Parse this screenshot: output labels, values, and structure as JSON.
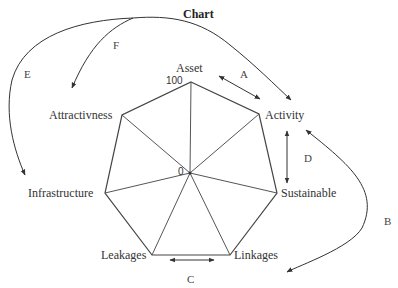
{
  "title": "Chart",
  "axes": [
    {
      "label": "Asset"
    },
    {
      "label": "Activity"
    },
    {
      "label": "Sustainable"
    },
    {
      "label": "Linkages"
    },
    {
      "label": "Leakages"
    },
    {
      "label": "Infrastructure"
    },
    {
      "label": "Attractivness"
    }
  ],
  "scale": {
    "min_label": "0",
    "max_label": "100"
  },
  "relations": [
    {
      "id": "A",
      "from": "Asset",
      "to": "Activity",
      "type": "double-arrow"
    },
    {
      "id": "B",
      "from": "Activity",
      "to": "Linkages",
      "type": "curved-double-arrow"
    },
    {
      "id": "C",
      "from": "Leakages",
      "to": "Linkages",
      "type": "double-arrow"
    },
    {
      "id": "D",
      "from": "Activity",
      "to": "Sustainable",
      "type": "double-arrow"
    },
    {
      "id": "E",
      "from": "Activity",
      "to": "Infrastructure",
      "type": "curved-arrow"
    },
    {
      "id": "F",
      "from": "Activity",
      "to": "Attractivness",
      "type": "curved-arrow"
    }
  ],
  "colors": {
    "line": "#333333",
    "text": "#333333",
    "background": "#ffffff"
  }
}
